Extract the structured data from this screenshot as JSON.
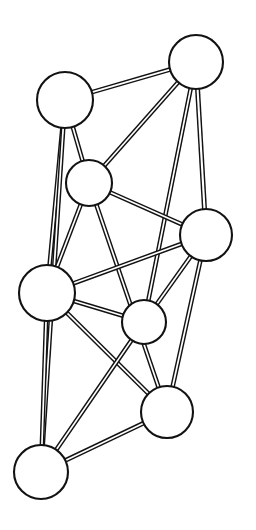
{
  "figure": {
    "type": "node-link-diagram",
    "style": "line-art, black outline circles on white background, edges drawn as thin double-stroke bands",
    "canvas": {
      "width": 256,
      "height": 530,
      "background": "#ffffff"
    },
    "ink_color": "#121212",
    "fill_color": "#ffffff"
  },
  "graph": {
    "node_count": 8,
    "edge_count": 17,
    "nodes": [
      {
        "id": "A",
        "label": "",
        "cx": 65,
        "cy": 100,
        "r": 28,
        "stroke_width": 2.1,
        "position_name": "upper-left"
      },
      {
        "id": "B",
        "label": "",
        "cx": 196,
        "cy": 62,
        "r": 27,
        "stroke_width": 2.1,
        "position_name": "top-right"
      },
      {
        "id": "C",
        "label": "",
        "cx": 89,
        "cy": 183,
        "r": 23,
        "stroke_width": 2.1,
        "position_name": "upper-middle"
      },
      {
        "id": "D",
        "label": "",
        "cx": 206,
        "cy": 235,
        "r": 26,
        "stroke_width": 2.1,
        "position_name": "right-middle"
      },
      {
        "id": "E",
        "label": "",
        "cx": 47,
        "cy": 293,
        "r": 28,
        "stroke_width": 2.1,
        "position_name": "left-middle"
      },
      {
        "id": "F",
        "label": "",
        "cx": 144,
        "cy": 322,
        "r": 22,
        "stroke_width": 2.1,
        "position_name": "lower-middle"
      },
      {
        "id": "G",
        "label": "",
        "cx": 167,
        "cy": 412,
        "r": 26,
        "stroke_width": 2.1,
        "position_name": "lower-right"
      },
      {
        "id": "H",
        "label": "",
        "cx": 41,
        "cy": 472,
        "r": 27,
        "stroke_width": 2.1,
        "position_name": "bottom-left"
      }
    ],
    "edges": [
      {
        "id": "e1",
        "source": "A",
        "target": "B",
        "band_width": 4.6
      },
      {
        "id": "e2",
        "source": "A",
        "target": "C",
        "band_width": 4.6
      },
      {
        "id": "e3",
        "source": "A",
        "target": "E",
        "band_width": 4.6
      },
      {
        "id": "e4",
        "source": "A",
        "target": "H",
        "band_width": 4.6
      },
      {
        "id": "e5",
        "source": "B",
        "target": "C",
        "band_width": 4.6
      },
      {
        "id": "e6",
        "source": "B",
        "target": "D",
        "band_width": 5.0
      },
      {
        "id": "e7",
        "source": "B",
        "target": "F",
        "band_width": 4.6
      },
      {
        "id": "e8",
        "source": "C",
        "target": "D",
        "band_width": 4.6
      },
      {
        "id": "e9",
        "source": "C",
        "target": "E",
        "band_width": 4.6
      },
      {
        "id": "e10",
        "source": "C",
        "target": "G",
        "band_width": 4.6
      },
      {
        "id": "e11",
        "source": "D",
        "target": "E",
        "band_width": 4.6
      },
      {
        "id": "e12",
        "source": "D",
        "target": "F",
        "band_width": 4.6
      },
      {
        "id": "e13",
        "source": "D",
        "target": "G",
        "band_width": 4.6
      },
      {
        "id": "e14",
        "source": "E",
        "target": "F",
        "band_width": 4.6
      },
      {
        "id": "e15",
        "source": "E",
        "target": "G",
        "band_width": 4.6
      },
      {
        "id": "e16",
        "source": "E",
        "target": "H",
        "band_width": 4.6
      },
      {
        "id": "e17",
        "source": "F",
        "target": "H",
        "band_width": 4.6
      },
      {
        "id": "e18",
        "source": "G",
        "target": "H",
        "band_width": 4.6
      }
    ]
  }
}
